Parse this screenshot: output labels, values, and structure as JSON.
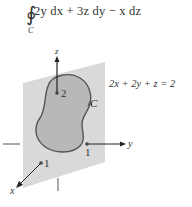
{
  "formula": {
    "integral_symbol": "∮",
    "subscript": "C",
    "expression": "2y dx + 3z dy − x dz"
  },
  "figure": {
    "plane_equation": "2x + 2y + z = 2",
    "curve_label": "C",
    "axes": {
      "z": {
        "label": "z",
        "intercept": "2"
      },
      "y": {
        "label": "y",
        "intercept": "1"
      },
      "x": {
        "label": "x",
        "intercept": "1"
      }
    },
    "colors": {
      "plane": "#d9d9d9",
      "region": "#b8b8b8",
      "outline": "#555555",
      "axis": "#333333"
    }
  }
}
